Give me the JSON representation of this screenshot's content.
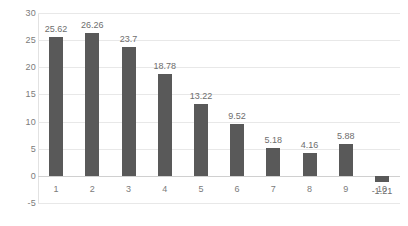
{
  "chart_data": {
    "type": "bar",
    "title": "",
    "subtitle": "",
    "xlabel": "",
    "ylabel": "",
    "categories": [
      "1",
      "2",
      "3",
      "4",
      "5",
      "6",
      "7",
      "8",
      "9",
      "10"
    ],
    "values": [
      25.62,
      26.26,
      23.7,
      18.78,
      13.22,
      9.52,
      5.18,
      4.16,
      5.88,
      -1.21
    ],
    "data_labels": [
      "25.62",
      "26.26",
      "23.7",
      "18.78",
      "13.22",
      "9.52",
      "5.18",
      "4.16",
      "5.88",
      "-1.21"
    ],
    "ylim": [
      -5,
      30
    ],
    "y_ticks": [
      30,
      25,
      20,
      15,
      10,
      5,
      0,
      -5
    ],
    "y_tick_labels": [
      "30",
      "25",
      "20",
      "15",
      "10",
      "5",
      "0",
      "-5"
    ],
    "grid": true,
    "grid_axis": "y",
    "legend": false,
    "legend_position": "none",
    "bar_color": "#595959",
    "gridline_color": "#e8e8e8",
    "axis_text_color": "#7b7b7b",
    "label_text_color": "#6e6e6e",
    "background_color": "#ffffff"
  }
}
